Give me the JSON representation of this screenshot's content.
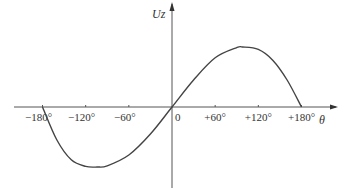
{
  "chart_data": {
    "type": "line",
    "title": "",
    "xlabel": "θ",
    "ylabel": "Uz",
    "xlim": [
      -180,
      180
    ],
    "x_tick_labels": [
      "−180°",
      "−120°",
      "−60°",
      "0",
      "+60°",
      "+120°",
      "+180°"
    ],
    "x_ticks": [
      -180,
      -120,
      -60,
      0,
      60,
      120,
      180
    ],
    "grid": false,
    "legend": null,
    "series": [
      {
        "name": "Uz(θ)",
        "x": [
          -180,
          -160,
          -140,
          -120,
          -104,
          -90,
          -60,
          -30,
          0,
          30,
          60,
          90,
          98,
          120,
          140,
          160,
          180
        ],
        "y": [
          0,
          -0.55,
          -0.88,
          -0.99,
          -1.0,
          -0.98,
          -0.8,
          -0.45,
          0,
          0.45,
          0.82,
          0.99,
          1.0,
          0.96,
          0.78,
          0.45,
          0
        ]
      }
    ]
  },
  "colors": {
    "axis": "#555555",
    "curve": "#444444"
  }
}
